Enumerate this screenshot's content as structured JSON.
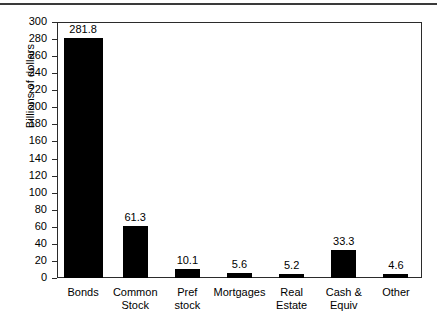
{
  "chart_data": {
    "type": "bar",
    "title": "",
    "xlabel": "",
    "ylabel": "Billions of dollars",
    "ylim": [
      0,
      300
    ],
    "ytick_step": 20,
    "grid": false,
    "legend": null,
    "bar_color": "#000000",
    "categories": [
      "Bonds",
      "Common\nStock",
      "Pref\nstock",
      "Mortgages",
      "Real\nEstate",
      "Cash &\nEquiv",
      "Other"
    ],
    "values": [
      281.8,
      61.3,
      10.1,
      5.6,
      5.2,
      33.3,
      4.6
    ],
    "value_labels": [
      "281.8",
      "61.3",
      "10.1",
      "5.6",
      "5.2",
      "33.3",
      "4.6"
    ],
    "yticks": [
      "0",
      "20",
      "40",
      "60",
      "80",
      "100",
      "120",
      "140",
      "160",
      "180",
      "200",
      "220",
      "240",
      "260",
      "280",
      "300"
    ]
  }
}
